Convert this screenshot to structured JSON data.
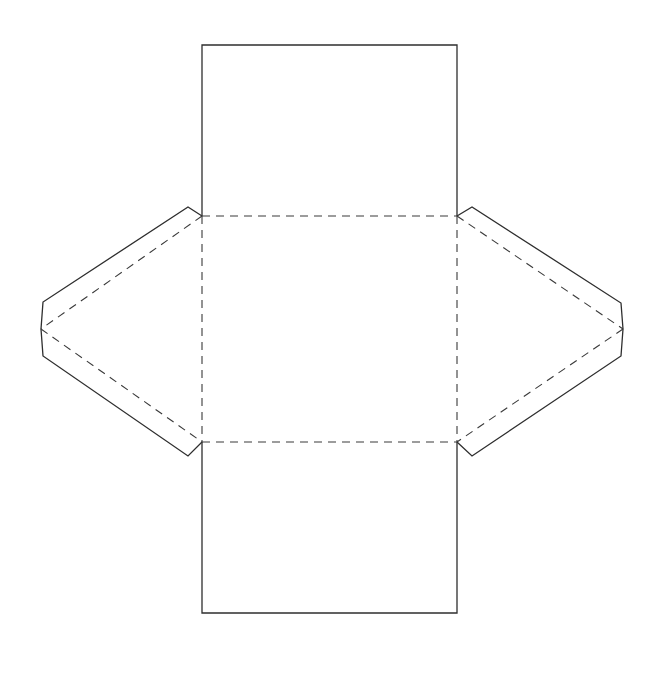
{
  "diagram": {
    "type": "paper-net-template",
    "canvas": {
      "width": 668,
      "height": 675,
      "background": "#ffffff"
    },
    "colors": {
      "cut_line": "#2e2e2e",
      "fold_line": "#3a3a3a"
    },
    "line_styles": {
      "cut": "solid",
      "fold": "dashed"
    },
    "body": {
      "left_x": 202,
      "right_x": 457,
      "top_y": 45,
      "fold_top_y": 216,
      "fold_bottom_y": 442,
      "bottom_y": 613
    },
    "left_flap": {
      "outline": [
        [
          202,
          216
        ],
        [
          188,
          207
        ],
        [
          43,
          302
        ],
        [
          41,
          329
        ],
        [
          43,
          356
        ],
        [
          188,
          456
        ],
        [
          202,
          442
        ]
      ],
      "fold_lines": [
        [
          [
            202,
            216
          ],
          [
            41,
            329
          ]
        ],
        [
          [
            41,
            329
          ],
          [
            202,
            442
          ]
        ]
      ]
    },
    "right_flap": {
      "outline": [
        [
          457,
          216
        ],
        [
          472,
          207
        ],
        [
          621,
          303
        ],
        [
          623,
          329
        ],
        [
          621,
          356
        ],
        [
          472,
          456
        ],
        [
          457,
          442
        ]
      ],
      "fold_lines": [
        [
          [
            457,
            216
          ],
          [
            623,
            329
          ]
        ],
        [
          [
            623,
            329
          ],
          [
            457,
            442
          ]
        ]
      ]
    }
  }
}
